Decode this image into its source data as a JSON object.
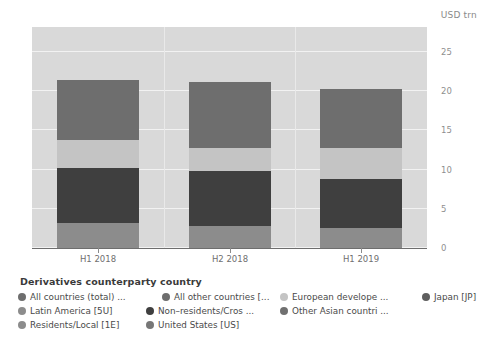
{
  "chart_data": {
    "type": "bar",
    "subtype": "stacked-bar",
    "title": "",
    "xlabel": "",
    "ylabel": "USD trn",
    "unit_label": "USD trn",
    "categories": [
      "H1 2018",
      "H2 2018",
      "H1 2019"
    ],
    "ylim": [
      0,
      28.2
    ],
    "yticks": [
      0,
      5,
      10,
      15,
      20,
      25
    ],
    "ytick_labels": [
      "0",
      "5",
      "10",
      "15",
      "20",
      "25"
    ],
    "grid": true,
    "legend_position": "bottom",
    "series": [
      {
        "name": "Residents/Local [1E]",
        "color": "#8c8c8c",
        "values": [
          3.2,
          2.8,
          2.6
        ]
      },
      {
        "name": "Non-residents/Cros",
        "color": "#3f3f3f",
        "values": [
          7.0,
          7.0,
          6.2
        ]
      },
      {
        "name": "European develope",
        "color": "#c4c4c4",
        "values": [
          3.6,
          3.0,
          4.0
        ]
      },
      {
        "name": "All countries (total)",
        "color": "#6e6e6e",
        "values": [
          7.7,
          8.4,
          7.5
        ]
      }
    ],
    "bar_totals": [
      21.5,
      21.2,
      20.3
    ]
  },
  "chart": {
    "unit_label": "USD trn",
    "ytick_labels": [
      "25",
      "20",
      "15",
      "10",
      "5",
      "0"
    ],
    "xtick_labels": [
      "H1 2018",
      "H2 2018",
      "H1 2019"
    ]
  },
  "legend": {
    "title": "Derivatives counterparty country",
    "items": [
      {
        "label": "All countries (total) ...",
        "color": "#6e6e6e"
      },
      {
        "label": "All other countries [...",
        "color": "#6e6e6e"
      },
      {
        "label": "European develope ...",
        "color": "#c4c4c4"
      },
      {
        "label": "Japan [JP]",
        "color": "#5e5e5e"
      },
      {
        "label": "Latin America [5U]",
        "color": "#8c8c8c"
      },
      {
        "label": "Non–residents/Cros ...",
        "color": "#3f3f3f"
      },
      {
        "label": "Other Asian countri ...",
        "color": "#707070"
      },
      {
        "label": "Residents/Local [1E]",
        "color": "#8c8c8c"
      },
      {
        "label": "United States [US]",
        "color": "#777777"
      }
    ]
  }
}
